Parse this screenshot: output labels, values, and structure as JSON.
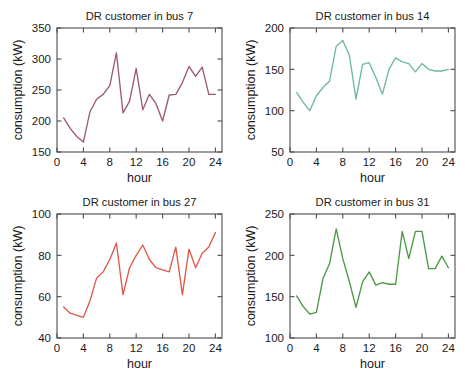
{
  "figure": {
    "panel_count": 4,
    "background_color": "#ffffff"
  },
  "chart_data": [
    {
      "id": "bus7",
      "type": "line",
      "title": "DR customer in bus 7",
      "xlabel": "hour",
      "ylabel": "consumption (kW)",
      "xlim": [
        0,
        25
      ],
      "ylim": [
        150,
        350
      ],
      "xticks": [
        0,
        4,
        8,
        12,
        16,
        20,
        24
      ],
      "yticks": [
        150,
        200,
        250,
        300,
        350
      ],
      "grid": false,
      "legend": "none",
      "color": "#9e5a72",
      "x": [
        1,
        2,
        3,
        4,
        5,
        6,
        7,
        8,
        9,
        10,
        11,
        12,
        13,
        14,
        15,
        16,
        17,
        18,
        19,
        20,
        21,
        22,
        23,
        24
      ],
      "values": [
        205,
        188,
        175,
        166,
        215,
        235,
        243,
        257,
        310,
        213,
        232,
        285,
        218,
        243,
        228,
        200,
        242,
        243,
        262,
        288,
        272,
        287,
        243,
        243
      ]
    },
    {
      "id": "bus14",
      "type": "line",
      "title": "DR customer in bus 14",
      "xlabel": "hour",
      "ylabel": "consumption (kW)",
      "xlim": [
        0,
        25
      ],
      "ylim": [
        50,
        200
      ],
      "xticks": [
        0,
        4,
        8,
        12,
        16,
        20,
        24
      ],
      "yticks": [
        50,
        100,
        150,
        200
      ],
      "grid": false,
      "legend": "none",
      "color": "#6fb7a6",
      "x": [
        1,
        2,
        3,
        4,
        5,
        6,
        7,
        8,
        9,
        10,
        11,
        12,
        13,
        14,
        15,
        16,
        17,
        18,
        19,
        20,
        21,
        22,
        23,
        24
      ],
      "values": [
        122,
        110,
        100,
        118,
        128,
        136,
        178,
        185,
        167,
        114,
        156,
        158,
        140,
        120,
        150,
        164,
        159,
        157,
        147,
        157,
        150,
        148,
        148,
        150
      ]
    },
    {
      "id": "bus27",
      "type": "line",
      "title": "DR customer in bus 27",
      "xlabel": "hour",
      "ylabel": "consumption (kW)",
      "xlim": [
        0,
        25
      ],
      "ylim": [
        40,
        100
      ],
      "xticks": [
        0,
        4,
        8,
        12,
        16,
        20,
        24
      ],
      "yticks": [
        40,
        60,
        80,
        100
      ],
      "grid": false,
      "legend": "none",
      "color": "#e05a4a",
      "x": [
        1,
        2,
        3,
        4,
        5,
        6,
        7,
        8,
        9,
        10,
        11,
        12,
        13,
        14,
        15,
        16,
        17,
        18,
        19,
        20,
        21,
        22,
        23,
        24
      ],
      "values": [
        55,
        52,
        51,
        50,
        58,
        69,
        72,
        78,
        86,
        61,
        74,
        80,
        85,
        78,
        74,
        73,
        72,
        84,
        61,
        83,
        74,
        81,
        84,
        91
      ]
    },
    {
      "id": "bus31",
      "type": "line",
      "title": "DR customer in bus 31",
      "xlabel": "hour",
      "ylabel": "consumption (kW)",
      "xlim": [
        0,
        25
      ],
      "ylim": [
        100,
        250
      ],
      "xticks": [
        0,
        4,
        8,
        12,
        16,
        20,
        24
      ],
      "yticks": [
        100,
        150,
        200,
        250
      ],
      "grid": false,
      "legend": "none",
      "color": "#4a9a45",
      "x": [
        1,
        2,
        3,
        4,
        5,
        6,
        7,
        8,
        9,
        10,
        11,
        12,
        13,
        14,
        15,
        16,
        17,
        18,
        19,
        20,
        21,
        22,
        23,
        24
      ],
      "values": [
        151,
        138,
        129,
        131,
        172,
        190,
        232,
        196,
        168,
        137,
        168,
        180,
        164,
        167,
        165,
        165,
        229,
        196,
        229,
        229,
        184,
        184,
        199,
        185
      ]
    }
  ]
}
